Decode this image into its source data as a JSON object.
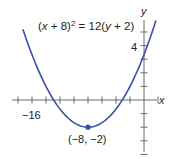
{
  "chart_data": {
    "type": "line",
    "title": "",
    "equation": {
      "lhs_open": "(",
      "lhs_var": "x",
      "lhs_rest": " + 8)",
      "exponent": "2",
      "equals_rhs_pre": " = 12(",
      "rhs_var": "y",
      "rhs_rest": " + 2)"
    },
    "xlabel": "x",
    "ylabel": "y",
    "x_tick_labels": [
      {
        "value": -16,
        "label": "−16"
      }
    ],
    "y_tick_labels": [
      {
        "value": 4,
        "label": "4"
      }
    ],
    "x_tick_step": 2,
    "y_tick_step": 1,
    "xlim": [
      -18,
      2
    ],
    "ylim": [
      -4.5,
      6
    ],
    "grid": false,
    "curve": {
      "name": "(x + 8)^2 = 12(y + 2)",
      "form": "parabola",
      "vertex": [
        -8,
        -2
      ],
      "x_range": [
        -17.3,
        1.7
      ],
      "color": "#3a4fa8"
    },
    "annotations": [
      {
        "point": [
          -8,
          -2
        ],
        "label": "(−8, −2)",
        "marker": "dot"
      }
    ],
    "axis_color": "#6b6b6b"
  }
}
